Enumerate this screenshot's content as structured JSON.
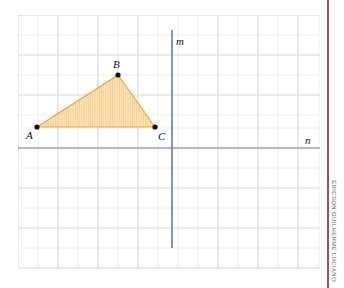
{
  "figure": {
    "background_color": "#ffffff"
  },
  "grid": {
    "x0": 18,
    "y0": 15,
    "cols": 15,
    "rows": 12.65,
    "cell": 20.1,
    "minor_color": "#e9e9ee",
    "major_color": "#d7d7de"
  },
  "lines": [
    {
      "name": "m",
      "label": "m",
      "orientation": "vertical",
      "x": 172,
      "y_start": 30,
      "y_end": 248,
      "color": "#6b78b4",
      "label_x": 176,
      "label_y": 45
    },
    {
      "name": "n",
      "label": "n",
      "orientation": "horizontal",
      "y": 148,
      "x_start": 18,
      "x_end": 320,
      "color": "#8aa6c8",
      "label_x": 305,
      "label_y": 144
    }
  ],
  "triangle": {
    "name": "ABC",
    "fill_color": "#fbe0b4",
    "stroke_color": "#e8a33d",
    "hatch_color": "#f0c27e",
    "vertices": [
      {
        "label": "A",
        "x": 37,
        "y": 127,
        "label_x": 26,
        "label_y": 139
      },
      {
        "label": "B",
        "x": 118,
        "y": 75,
        "label_x": 113,
        "label_y": 68
      },
      {
        "label": "C",
        "x": 155,
        "y": 127,
        "label_x": 158,
        "label_y": 140
      }
    ],
    "vertex_dot_color": "#111111",
    "vertex_dot_radius": 2.6
  },
  "credit": {
    "text": "ERICSON GUILHERME LUCIANO",
    "rule_color": "#9e4a63",
    "text_color": "#6b6b6b"
  }
}
